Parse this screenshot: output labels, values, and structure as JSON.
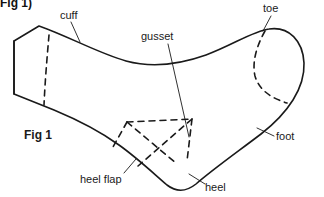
{
  "figure": {
    "title_top": "Fig 1)",
    "caption": "Fig 1",
    "stroke_color": "#1a1a1a",
    "background_color": "#ffffff"
  },
  "labels": {
    "cuff": "cuff",
    "gusset": "gusset",
    "toe": "toe",
    "foot": "foot",
    "heel_flap": "heel flap",
    "heel": "heel"
  },
  "parts": [
    {
      "name": "cuff",
      "label": "cuff",
      "label_x": 60,
      "label_y": 10
    },
    {
      "name": "gusset",
      "label": "gusset",
      "label_x": 141,
      "label_y": 31
    },
    {
      "name": "toe",
      "label": "toe",
      "label_x": 263,
      "label_y": 3
    },
    {
      "name": "foot",
      "label": "foot",
      "label_x": 276,
      "label_y": 131
    },
    {
      "name": "heel-flap",
      "label": "heel flap",
      "label_x": 80,
      "label_y": 174
    },
    {
      "name": "heel",
      "label": "heel",
      "label_x": 205,
      "label_y": 182
    }
  ],
  "geometry": {
    "outline": "M 14 41 L 39 26 C 72 38 100 54 127 62 C 152 69 178 66 205 56 C 232 46 252 32 268 29 C 288 25 303 40 304 62 C 305 86 290 111 263 132 C 236 153 212 170 196 184 C 186 192 175 192 166 184 C 152 172 135 156 118 144 C 100 131 78 120 54 110 L 14 94 Z",
    "cuff_edge": "M 14 41 L 14 94",
    "cuff_dash": "M 47 36 L 43 104",
    "toe_dash": "M 264 31 C 256 48 253 65 257 78 C 261 91 272 98 286 102",
    "heel_dash_top": "M 128 122 L 192 119",
    "heel_dash_left": "M 128 122 L 115 146",
    "heel_dash_diag1": "M 128 122 L 176 163",
    "heel_dash_diag2": "M 192 119 L 139 165",
    "heel_dash_right": "M 192 119 L 186 160",
    "leader_cuff": "M 70 22 L 79 42",
    "leader_gusset": "M 167 43 L 188 136",
    "leader_toe": "M 269 15 L 262 31",
    "leader_foot": "M 275 136 L 258 128",
    "leader_heelflap": "M 123 173 L 135 159",
    "leader_heel": "M 206 184 L 189 173"
  }
}
